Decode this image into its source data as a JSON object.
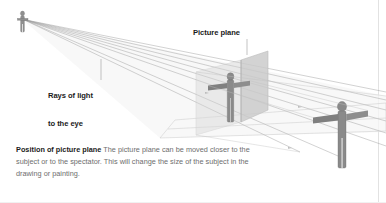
{
  "figure": {
    "title": "Position of picture plane",
    "type": "perspective-diagram",
    "background_color": "#ffffff"
  },
  "labels": {
    "picture_plane": "Picture plane",
    "rays_line1": "Rays of light",
    "rays_line2": "to the eye"
  },
  "caption": {
    "lead": "Position of picture plane",
    "body": " The picture plane can be moved closer to the subject or to the spectator. This will change the size of the subject in the drawing or painting."
  },
  "colors": {
    "figure_fill": "#8f8f8f",
    "figure_stroke": "#6f6f6f",
    "picture_plane_fill": "#cfcfcf",
    "ground_plane_fill": "#ededed",
    "ray_stroke": "#9a9a9a",
    "construction_stroke": "#bdbdbd",
    "label_text": "#1b1b1b",
    "caption_text": "#6e6e6e",
    "leader_line": "#9a9a9a",
    "edge_rule": "#e2e2e2"
  },
  "scene": {
    "eye_point": {
      "x": 23,
      "y": 20
    },
    "spectator_label": "spectator figure at eye point",
    "projected_subject_label": "subject projected on picture plane",
    "subject_label": "subject figure",
    "ray_count": 6
  }
}
